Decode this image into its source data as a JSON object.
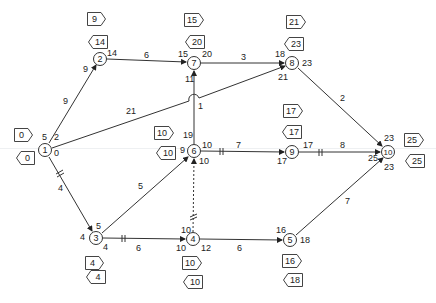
{
  "diagram": {
    "type": "activity-on-node network (critical path)",
    "nodes": [
      {
        "id": "1",
        "x": 45,
        "y": 150,
        "es": "0",
        "lf": "0"
      },
      {
        "id": "2",
        "x": 100,
        "y": 59,
        "es": "9",
        "lf": "14"
      },
      {
        "id": "3",
        "x": 96,
        "y": 238,
        "es": "4",
        "lf": "4"
      },
      {
        "id": "4",
        "x": 193,
        "y": 239,
        "es": "10",
        "lf": "10"
      },
      {
        "id": "5",
        "x": 290,
        "y": 240,
        "es": "16",
        "lf": "18"
      },
      {
        "id": "6",
        "x": 194,
        "y": 151,
        "es": "10",
        "lf": "10"
      },
      {
        "id": "7",
        "x": 194,
        "y": 63,
        "es": "15",
        "lf": "20"
      },
      {
        "id": "8",
        "x": 292,
        "y": 63,
        "es": "21",
        "lf": "23"
      },
      {
        "id": "9",
        "x": 292,
        "y": 152,
        "es": "17",
        "lf": "17"
      },
      {
        "id": "10",
        "x": 388,
        "y": 152,
        "es": "25",
        "lf": "25"
      }
    ],
    "edges": [
      {
        "from": "1",
        "to": "2",
        "weight": "9",
        "critical": false,
        "dashed": false
      },
      {
        "from": "1",
        "to": "8",
        "weight": "21",
        "critical": false,
        "dashed": false
      },
      {
        "from": "1",
        "to": "3",
        "weight": "4",
        "critical": true,
        "dashed": false
      },
      {
        "from": "2",
        "to": "7",
        "weight": "6",
        "critical": false,
        "dashed": false
      },
      {
        "from": "3",
        "to": "6",
        "weight": "5",
        "critical": false,
        "dashed": false
      },
      {
        "from": "3",
        "to": "4",
        "weight": "6",
        "critical": true,
        "dashed": false
      },
      {
        "from": "4",
        "to": "6",
        "weight": "",
        "critical": true,
        "dashed": true
      },
      {
        "from": "4",
        "to": "5",
        "weight": "6",
        "critical": false,
        "dashed": false
      },
      {
        "from": "6",
        "to": "7",
        "weight": "1",
        "critical": false,
        "dashed": false
      },
      {
        "from": "6",
        "to": "9",
        "weight": "7",
        "critical": true,
        "dashed": false
      },
      {
        "from": "7",
        "to": "8",
        "weight": "3",
        "critical": false,
        "dashed": false
      },
      {
        "from": "8",
        "to": "10",
        "weight": "2",
        "critical": false,
        "dashed": false
      },
      {
        "from": "9",
        "to": "10",
        "weight": "8",
        "critical": true,
        "dashed": false
      },
      {
        "from": "5",
        "to": "10",
        "weight": "7",
        "critical": false,
        "dashed": false
      }
    ],
    "edge_labels": {
      "e12": "9",
      "e18": "21",
      "e13": "4",
      "e27": "6",
      "e36": "5",
      "e34": "6",
      "e45": "6",
      "e67": "1",
      "e69": "7",
      "e78": "3",
      "e810": "2",
      "e910": "8",
      "e510": "7"
    },
    "time_labels": {
      "n1_a": "5",
      "n1_b": "2",
      "n1_c": "0",
      "n2_in": "9",
      "n2_out": "14",
      "n3_in": "5",
      "n3_left": "4",
      "n3_out": "4",
      "n4_top": "10",
      "n4_in": "10",
      "n4_out": "12",
      "n5_in": "16",
      "n5_out": "18",
      "n6_top": "19",
      "n6_left": "9",
      "n6_right": "10",
      "n6_bottom": "10",
      "n7_in": "15",
      "n7_out": "20",
      "n7_bottom": "11",
      "n8_in": "18",
      "n8_in2": "21",
      "n8_out": "23",
      "n9_in": "17",
      "n9_out": "17",
      "n10_top": "23",
      "n10_left": "25",
      "n10_bottom": "23"
    },
    "node_labels": {
      "n1": "1",
      "n2": "2",
      "n3": "3",
      "n4": "4",
      "n5": "5",
      "n6": "6",
      "n7": "7",
      "n8": "8",
      "n9": "9",
      "n10": "10"
    },
    "tags": {
      "n1_es": "0",
      "n1_lf": "0",
      "n2_es": "9",
      "n2_lf": "14",
      "n3_es": "4",
      "n3_lf": "4",
      "n4_es": "10",
      "n4_lf": "10",
      "n5_es": "16",
      "n5_lf": "18",
      "n6_es": "10",
      "n6_lf": "10",
      "n7_es": "15",
      "n7_lf": "20",
      "n8_es": "21",
      "n8_lf": "23",
      "n9_es": "17",
      "n9_lf": "17",
      "n10_es": "25",
      "n10_lf": "25"
    },
    "colors": {
      "line": "#333333",
      "text": "#222222",
      "background": "#ffffff"
    }
  }
}
